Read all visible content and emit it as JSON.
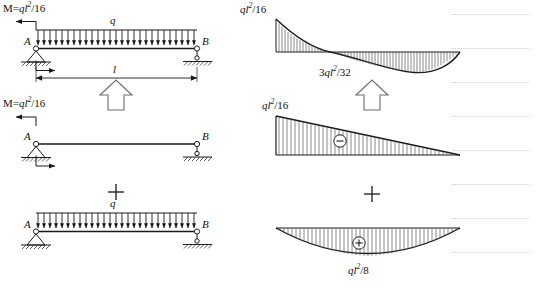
{
  "figure": {
    "kind": "structural-beam-superposition",
    "background": "#ffffff",
    "line_color": "#1a1a1a",
    "hatch_color": "#555555"
  },
  "left_column": {
    "panel_1": {
      "moment_label": {
        "prefix": "M=",
        "base": "ql",
        "sup": "2",
        "suffix": "/16"
      },
      "load_label": "q",
      "support_left_label": "A",
      "support_right_label": "B",
      "span_label": "l",
      "support_left_type": "pinned-support",
      "support_right_type": "roller-support",
      "load_arrow_count": 27
    },
    "panel_2": {
      "moment_label": {
        "prefix": "M=",
        "base": "ql",
        "sup": "2",
        "suffix": "/16"
      },
      "support_left_label": "A",
      "support_right_label": "B",
      "support_left_type": "pinned-support",
      "support_right_type": "roller-support"
    },
    "panel_3": {
      "load_label": "q",
      "support_left_label": "A",
      "support_right_label": "B",
      "support_left_type": "pinned-support",
      "support_right_type": "roller-support",
      "load_arrow_count": 27
    },
    "plus_sign": "+",
    "equals_arrow": "up-arrow"
  },
  "right_column": {
    "panel_1": {
      "peak_label": {
        "base": "ql",
        "sup": "2",
        "suffix": "/16"
      },
      "mid_label": {
        "prefix": "3",
        "base": "ql",
        "sup": "2",
        "suffix": "/32"
      },
      "diagram_type": "combined-bending-moment"
    },
    "panel_2": {
      "peak_label": {
        "base": "ql",
        "sup": "2",
        "suffix": "/16"
      },
      "sign_symbol": "minus-circle",
      "diagram_type": "triangular-moment"
    },
    "panel_3": {
      "peak_label": {
        "base": "ql",
        "sup": "2",
        "suffix": "/8"
      },
      "sign_symbol": "plus-circle",
      "diagram_type": "parabolic-moment"
    },
    "plus_sign": "+",
    "equals_arrow": "up-arrow"
  },
  "ruled_lines": {
    "count": 7,
    "color": "#c9c9c9",
    "x": 452,
    "width": 78,
    "y_positions": [
      14,
      48,
      82,
      116,
      150,
      184,
      218,
      252
    ]
  }
}
